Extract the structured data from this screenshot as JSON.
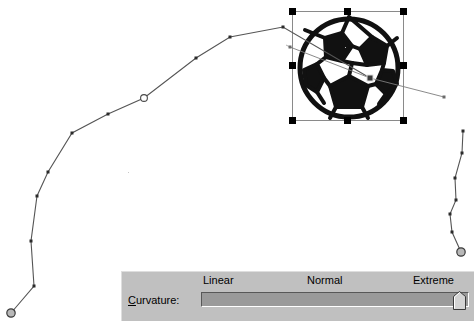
{
  "app": {
    "background_color": "#ffffff",
    "canvas_width": 474,
    "canvas_height": 328
  },
  "curvature_panel": {
    "face_color": "#c0c0c0",
    "label": "Curvature:",
    "label_accelerator": "C",
    "ticks": [
      {
        "name": "linear",
        "label": "Linear"
      },
      {
        "name": "normal",
        "label": "Normal"
      },
      {
        "name": "extreme",
        "label": "Extreme"
      }
    ],
    "slider": {
      "value_label": "Extreme",
      "value_percent": 100,
      "min_label": "Linear",
      "max_label": "Extreme",
      "track_color": "#9a9a9a",
      "thumb_color": "#c0c0c0"
    }
  },
  "selection": {
    "object_name": "soccer-ball-image",
    "handle_count": 8,
    "handle_color": "#000000",
    "frame_color": "#8a8a8a",
    "bounds": {
      "x": 292,
      "y": 11,
      "width": 112,
      "height": 110
    }
  },
  "path_editor": {
    "stroke_color": "#4a4a4a",
    "anchor_color": "#2a2a2a",
    "endpoint_style": "hollow-circle",
    "tangent_handle_color": "#808080",
    "left_path_points": [
      {
        "x": 11,
        "y": 313,
        "type": "endpoint"
      },
      {
        "x": 34,
        "y": 286,
        "type": "anchor"
      },
      {
        "x": 31,
        "y": 241,
        "type": "anchor"
      },
      {
        "x": 37,
        "y": 196,
        "type": "anchor"
      },
      {
        "x": 48,
        "y": 172,
        "type": "anchor"
      },
      {
        "x": 72,
        "y": 133,
        "type": "anchor"
      },
      {
        "x": 108,
        "y": 114,
        "type": "anchor"
      },
      {
        "x": 144,
        "y": 98,
        "type": "smooth-node"
      },
      {
        "x": 196,
        "y": 58,
        "type": "anchor"
      },
      {
        "x": 230,
        "y": 37,
        "type": "anchor"
      },
      {
        "x": 283,
        "y": 27,
        "type": "anchor"
      },
      {
        "x": 370,
        "y": 78,
        "type": "anchor"
      }
    ],
    "right_path_points": [
      {
        "x": 463,
        "y": 131,
        "type": "anchor"
      },
      {
        "x": 462,
        "y": 153,
        "type": "anchor"
      },
      {
        "x": 455,
        "y": 178,
        "type": "anchor"
      },
      {
        "x": 456,
        "y": 200,
        "type": "anchor"
      },
      {
        "x": 450,
        "y": 214,
        "type": "anchor"
      },
      {
        "x": 452,
        "y": 232,
        "type": "anchor"
      },
      {
        "x": 461,
        "y": 252,
        "type": "endpoint"
      }
    ],
    "control_node": {
      "x": 370,
      "y": 78
    },
    "tangent_arms": [
      {
        "from_x": 370,
        "from_y": 78,
        "to_x": 292,
        "to_y": 48
      },
      {
        "from_x": 370,
        "from_y": 78,
        "to_x": 443,
        "to_y": 96
      }
    ]
  }
}
